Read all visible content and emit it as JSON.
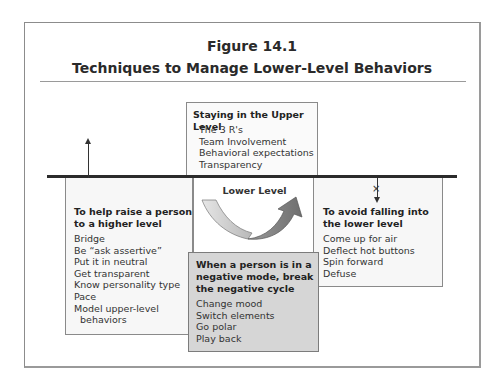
{
  "figure": {
    "number": "Figure 14.1",
    "title": "Techniques to Manage Lower-Level Behaviors"
  },
  "upper_box": {
    "heading": "Staying in the Upper Level",
    "items": [
      "The 3 R's",
      "Team Involvement",
      "Behavioral expectations",
      "Transparency"
    ]
  },
  "middle": {
    "label": "Lower Level",
    "icon": "u-turn-arrow-icon"
  },
  "left_box": {
    "heading": "To help raise a person to a higher level",
    "items": [
      "Bridge",
      "Be “ask assertive”",
      "Put it in neutral",
      "Get transparent",
      "Know personality type",
      "Pace",
      "Model upper-level",
      "behaviors"
    ]
  },
  "right_box": {
    "heading": "To avoid falling into the lower level",
    "items": [
      "Come up for air",
      "Deflect hot buttons",
      "Spin forward",
      "Defuse"
    ]
  },
  "negative_box": {
    "heading": "When a person is in a negative mode, break the negative cycle",
    "items": [
      "Change mood",
      "Switch elements",
      "Go polar",
      "Play back"
    ]
  },
  "symbols": {
    "left_arrow": "up-arrow-icon",
    "right_arrow": "blocked-down-arrow-icon",
    "x_mark": "×"
  },
  "colors": {
    "divider_line": "#2b2b2b",
    "negative_box_bg": "#d6d6d6",
    "box_border": "#8a8a8a"
  }
}
